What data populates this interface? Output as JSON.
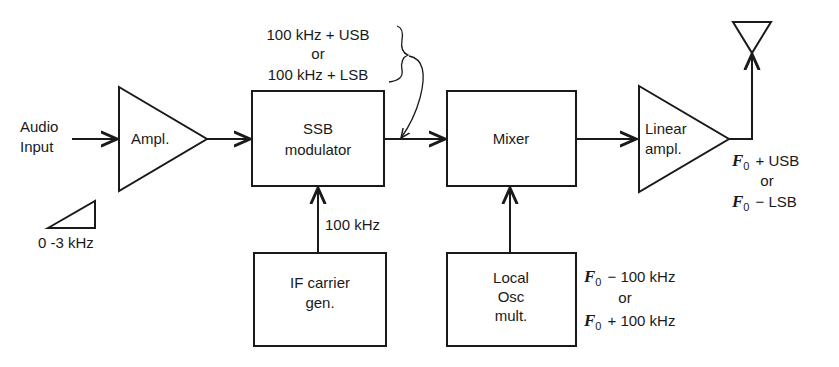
{
  "diagram": {
    "type": "block-diagram",
    "blocks": {
      "audio_input": {
        "line1": "Audio",
        "line2": "Input"
      },
      "audio_spectrum": {
        "label": "0 -3 kHz"
      },
      "ampl": {
        "label": "Ampl."
      },
      "ssb_modulator": {
        "line1": "SSB",
        "line2": "modulator"
      },
      "if_carrier": {
        "line1": "IF carrier",
        "line2": "gen."
      },
      "mixer": {
        "label": "Mixer"
      },
      "local_osc": {
        "line1": "Local",
        "line2": "Osc",
        "line3": "mult."
      },
      "linear_ampl": {
        "line1": "Linear",
        "line2": "ampl."
      }
    },
    "annotations": {
      "modulator_output": {
        "line1": "100 kHz + USB",
        "line2": "or",
        "line3": "100 kHz + LSB"
      },
      "if_carrier_freq": "100 kHz",
      "lo_freq": {
        "line1_var": "F",
        "line1_sub": "0",
        "line1_rest": "− 100 kHz",
        "line2": "or",
        "line3_var": "F",
        "line3_sub": "0",
        "line3_rest": "+ 100 kHz"
      },
      "output_freq": {
        "line1_var": "F",
        "line1_sub": "0",
        "line1_rest": "+ USB",
        "line2": "or",
        "line3_var": "F",
        "line3_sub": "0",
        "line3_rest": "− LSB"
      }
    },
    "connections": [
      [
        "audio_input",
        "ampl"
      ],
      [
        "ampl",
        "ssb_modulator"
      ],
      [
        "if_carrier",
        "ssb_modulator"
      ],
      [
        "ssb_modulator",
        "mixer"
      ],
      [
        "local_osc",
        "mixer"
      ],
      [
        "mixer",
        "linear_ampl"
      ],
      [
        "linear_ampl",
        "antenna"
      ]
    ]
  }
}
